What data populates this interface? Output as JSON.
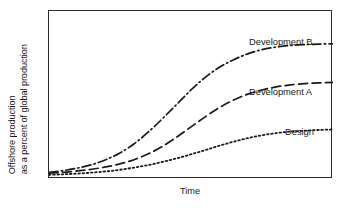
{
  "figure": {
    "background_color": "#ffffff",
    "frame_color": "#2b2b2b",
    "line_color": "#1a1a1a"
  },
  "axes": {
    "y_label_line_1": "Offshore production",
    "y_label_line_2": "as a percent of global production",
    "x_label": "Time"
  },
  "series_labels": {
    "development_b": "Development B",
    "development_a": "Development A",
    "design": "Design"
  },
  "chart_data": {
    "type": "line",
    "title": "",
    "xlabel": "Time",
    "ylabel": "Offshore production as a percent of global production",
    "xlim": [
      0,
      100
    ],
    "ylim": [
      0,
      100
    ],
    "grid": false,
    "axis_ticks": false,
    "axis_tick_labels": false,
    "legend": "inline-labels-at-curve-ends",
    "x": [
      0,
      5,
      10,
      15,
      20,
      25,
      30,
      35,
      40,
      45,
      50,
      55,
      60,
      65,
      70,
      75,
      80,
      85,
      90,
      95,
      100
    ],
    "series": [
      {
        "name": "Development B",
        "line_style": "dash-dot",
        "color": "#1a1a1a",
        "values": [
          4,
          5,
          6.5,
          8.5,
          11.5,
          15.5,
          21,
          28,
          36,
          44.5,
          53,
          60.5,
          66.5,
          71,
          74.5,
          77,
          78.5,
          79.5,
          80,
          80.3,
          80.5
        ]
      },
      {
        "name": "Development A",
        "line_style": "dashed",
        "color": "#1a1a1a",
        "values": [
          3.5,
          4,
          4.8,
          5.8,
          7.2,
          9,
          11.5,
          15,
          19.5,
          25,
          31,
          37,
          42.5,
          47,
          50.5,
          53,
          54.8,
          56,
          56.8,
          57.2,
          57.5
        ]
      },
      {
        "name": "Design",
        "line_style": "dotted",
        "color": "#1a1a1a",
        "values": [
          2.5,
          2.8,
          3.2,
          3.8,
          4.5,
          5.5,
          6.8,
          8.3,
          10.2,
          12.3,
          14.7,
          17.2,
          19.8,
          22.2,
          24.3,
          26,
          27.3,
          28.2,
          28.8,
          29.2,
          29.5
        ]
      }
    ],
    "annotations": [
      {
        "text": "Development B",
        "attached_to": "Development B",
        "position": "upper-right"
      },
      {
        "text": "Development A",
        "attached_to": "Development A",
        "position": "middle-right"
      },
      {
        "text": "Design",
        "attached_to": "Design",
        "position": "lower-right"
      }
    ]
  }
}
